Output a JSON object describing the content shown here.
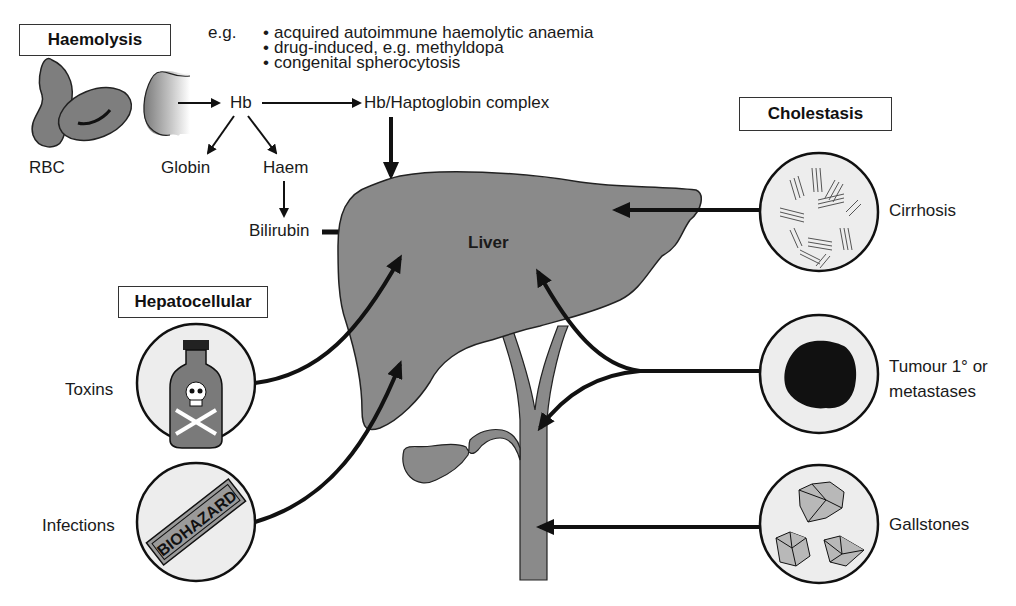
{
  "diagram": {
    "colors": {
      "organ_fill": "#8a8a8a",
      "circle_fill": "#ededed",
      "stroke": "#111111",
      "background": "#ffffff"
    },
    "categories": {
      "haemolysis": "Haemolysis",
      "hepatocellular": "Hepatocellular",
      "cholestasis": "Cholestasis"
    },
    "haemolysis_examples": {
      "prefix": "e.g.",
      "bullet": "•",
      "items": [
        "acquired autoimmune haemolytic anaemia",
        "drug-induced, e.g. methyldopa",
        "congenital spherocytosis"
      ]
    },
    "pathway": {
      "rbc": "RBC",
      "hb": "Hb",
      "complex": "Hb/Haptoglobin complex",
      "globin": "Globin",
      "haem": "Haem",
      "bilirubin": "Bilirubin"
    },
    "organ": {
      "liver": "Liver"
    },
    "hepatocellular_causes": [
      {
        "label": "Toxins",
        "icon": "poison-bottle-icon"
      },
      {
        "label": "Infections",
        "icon": "biohazard-label-icon",
        "icon_text": "BIOHAZARD"
      }
    ],
    "cholestasis_causes": [
      {
        "label": "Cirrhosis",
        "icon": "fibrosis-icon"
      },
      {
        "label_line1": "Tumour 1° or",
        "label_line2": "metastases",
        "icon": "tumour-mass-icon"
      },
      {
        "label": "Gallstones",
        "icon": "gallstones-icon"
      }
    ]
  }
}
